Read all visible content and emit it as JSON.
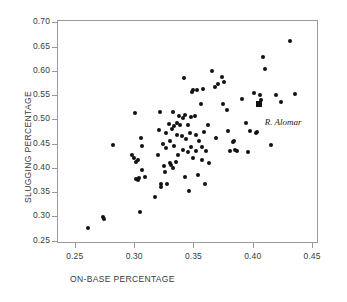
{
  "chart_data": {
    "type": "scatter",
    "title": "",
    "xlabel": "ON-BASE PERCENTAGE",
    "ylabel": "SLUGGING PERCENTAGE",
    "xlim": [
      0.235,
      0.455
    ],
    "ylim": [
      0.245,
      0.705
    ],
    "xticks": [
      "0.25",
      "0.30",
      "0.35",
      "0.40",
      "0.45"
    ],
    "xtick_values": [
      0.25,
      0.3,
      0.35,
      0.4,
      0.45
    ],
    "yticks": [
      "0.25",
      "0.30",
      "0.35",
      "0.40",
      "0.45",
      "0.50",
      "0.55",
      "0.60",
      "0.65",
      "0.70"
    ],
    "ytick_values": [
      0.25,
      0.3,
      0.35,
      0.4,
      0.45,
      0.5,
      0.55,
      0.6,
      0.65,
      0.7
    ],
    "grid": false,
    "legend": false,
    "marker_color": "#111111",
    "frame_color": "#9a9a9a",
    "annotations": [
      {
        "label": "R. Alomar",
        "x": 0.405,
        "y": 0.532,
        "style": "italic-serif",
        "dx": 6,
        "dy": 13
      }
    ],
    "highlight_points": [
      {
        "x": 0.405,
        "y": 0.532,
        "marker": "square",
        "label": "R. Alomar"
      }
    ],
    "points": [
      {
        "x": 0.261,
        "y": 0.275
      },
      {
        "x": 0.274,
        "y": 0.299
      },
      {
        "x": 0.275,
        "y": 0.295
      },
      {
        "x": 0.282,
        "y": 0.448
      },
      {
        "x": 0.298,
        "y": 0.427
      },
      {
        "x": 0.3,
        "y": 0.421
      },
      {
        "x": 0.301,
        "y": 0.513
      },
      {
        "x": 0.302,
        "y": 0.413
      },
      {
        "x": 0.302,
        "y": 0.378
      },
      {
        "x": 0.303,
        "y": 0.375
      },
      {
        "x": 0.303,
        "y": 0.417
      },
      {
        "x": 0.304,
        "y": 0.38
      },
      {
        "x": 0.305,
        "y": 0.308
      },
      {
        "x": 0.306,
        "y": 0.462
      },
      {
        "x": 0.307,
        "y": 0.446
      },
      {
        "x": 0.307,
        "y": 0.396
      },
      {
        "x": 0.309,
        "y": 0.381
      },
      {
        "x": 0.318,
        "y": 0.34
      },
      {
        "x": 0.32,
        "y": 0.427
      },
      {
        "x": 0.321,
        "y": 0.479
      },
      {
        "x": 0.322,
        "y": 0.516
      },
      {
        "x": 0.323,
        "y": 0.366
      },
      {
        "x": 0.323,
        "y": 0.361
      },
      {
        "x": 0.324,
        "y": 0.45
      },
      {
        "x": 0.325,
        "y": 0.404
      },
      {
        "x": 0.326,
        "y": 0.392
      },
      {
        "x": 0.327,
        "y": 0.472
      },
      {
        "x": 0.327,
        "y": 0.44
      },
      {
        "x": 0.328,
        "y": 0.367
      },
      {
        "x": 0.329,
        "y": 0.49
      },
      {
        "x": 0.33,
        "y": 0.455
      },
      {
        "x": 0.33,
        "y": 0.411
      },
      {
        "x": 0.331,
        "y": 0.406
      },
      {
        "x": 0.332,
        "y": 0.481
      },
      {
        "x": 0.333,
        "y": 0.516
      },
      {
        "x": 0.333,
        "y": 0.399
      },
      {
        "x": 0.334,
        "y": 0.487
      },
      {
        "x": 0.334,
        "y": 0.445
      },
      {
        "x": 0.335,
        "y": 0.413
      },
      {
        "x": 0.336,
        "y": 0.492
      },
      {
        "x": 0.336,
        "y": 0.468
      },
      {
        "x": 0.337,
        "y": 0.427
      },
      {
        "x": 0.338,
        "y": 0.508
      },
      {
        "x": 0.339,
        "y": 0.488
      },
      {
        "x": 0.34,
        "y": 0.465
      },
      {
        "x": 0.341,
        "y": 0.436
      },
      {
        "x": 0.341,
        "y": 0.503
      },
      {
        "x": 0.342,
        "y": 0.585
      },
      {
        "x": 0.343,
        "y": 0.51
      },
      {
        "x": 0.343,
        "y": 0.382
      },
      {
        "x": 0.344,
        "y": 0.459
      },
      {
        "x": 0.345,
        "y": 0.488
      },
      {
        "x": 0.345,
        "y": 0.432
      },
      {
        "x": 0.346,
        "y": 0.353
      },
      {
        "x": 0.347,
        "y": 0.472
      },
      {
        "x": 0.348,
        "y": 0.505
      },
      {
        "x": 0.348,
        "y": 0.443
      },
      {
        "x": 0.349,
        "y": 0.557
      },
      {
        "x": 0.35,
        "y": 0.561
      },
      {
        "x": 0.35,
        "y": 0.421
      },
      {
        "x": 0.351,
        "y": 0.506
      },
      {
        "x": 0.352,
        "y": 0.467
      },
      {
        "x": 0.352,
        "y": 0.434
      },
      {
        "x": 0.353,
        "y": 0.56
      },
      {
        "x": 0.354,
        "y": 0.386
      },
      {
        "x": 0.355,
        "y": 0.455
      },
      {
        "x": 0.356,
        "y": 0.531
      },
      {
        "x": 0.357,
        "y": 0.443
      },
      {
        "x": 0.357,
        "y": 0.416
      },
      {
        "x": 0.358,
        "y": 0.562
      },
      {
        "x": 0.359,
        "y": 0.475
      },
      {
        "x": 0.36,
        "y": 0.366
      },
      {
        "x": 0.361,
        "y": 0.434
      },
      {
        "x": 0.362,
        "y": 0.488
      },
      {
        "x": 0.363,
        "y": 0.411
      },
      {
        "x": 0.366,
        "y": 0.6
      },
      {
        "x": 0.368,
        "y": 0.566
      },
      {
        "x": 0.369,
        "y": 0.462
      },
      {
        "x": 0.371,
        "y": 0.572
      },
      {
        "x": 0.374,
        "y": 0.588
      },
      {
        "x": 0.375,
        "y": 0.531
      },
      {
        "x": 0.376,
        "y": 0.577
      },
      {
        "x": 0.378,
        "y": 0.52
      },
      {
        "x": 0.379,
        "y": 0.476
      },
      {
        "x": 0.381,
        "y": 0.435
      },
      {
        "x": 0.383,
        "y": 0.453
      },
      {
        "x": 0.384,
        "y": 0.456
      },
      {
        "x": 0.385,
        "y": 0.436
      },
      {
        "x": 0.387,
        "y": 0.435
      },
      {
        "x": 0.391,
        "y": 0.542
      },
      {
        "x": 0.394,
        "y": 0.492
      },
      {
        "x": 0.396,
        "y": 0.432
      },
      {
        "x": 0.398,
        "y": 0.477
      },
      {
        "x": 0.401,
        "y": 0.554
      },
      {
        "x": 0.403,
        "y": 0.471
      },
      {
        "x": 0.404,
        "y": 0.474
      },
      {
        "x": 0.406,
        "y": 0.551
      },
      {
        "x": 0.407,
        "y": 0.54
      },
      {
        "x": 0.409,
        "y": 0.629
      },
      {
        "x": 0.41,
        "y": 0.603
      },
      {
        "x": 0.415,
        "y": 0.448
      },
      {
        "x": 0.42,
        "y": 0.551
      },
      {
        "x": 0.424,
        "y": 0.536
      },
      {
        "x": 0.431,
        "y": 0.662
      },
      {
        "x": 0.436,
        "y": 0.553
      }
    ]
  }
}
